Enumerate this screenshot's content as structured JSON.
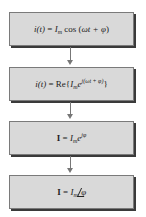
{
  "diagram": {
    "type": "flowchart",
    "direction": "top-to-bottom",
    "colors": {
      "box_fill": "#d9d9d9",
      "box_border": "#7a7a7a",
      "shadow": "#3a3a3a",
      "arrow": "#777777"
    },
    "boxes": [
      {
        "id": "step1",
        "text": "i(t) = I_m cos(ωt + φ)",
        "parts": {
          "lhs": "i(t)",
          "eq": " = ",
          "amp": "I",
          "amp_sub": "m",
          "fn": " cos (",
          "arg": "ωt + φ",
          "close": ")"
        }
      },
      {
        "id": "step2",
        "text": "i(t) = Re{I_m e^{j(ωt + φ)}}",
        "parts": {
          "lhs": "i(t)",
          "eq": " = Re{",
          "amp": "I",
          "amp_sub": "m",
          "base": "e",
          "exp": "j(ωt + φ)",
          "close": "}"
        }
      },
      {
        "id": "step3",
        "text": "I = I_m e^{jφ}",
        "parts": {
          "lhs": "I",
          "eq": " = ",
          "amp": "I",
          "amp_sub": "m",
          "base": "e",
          "exp": "jφ"
        }
      },
      {
        "id": "step4",
        "text": "I = I_m ∠φ",
        "parts": {
          "lhs": "I",
          "eq": " = ",
          "amp": "I",
          "amp_sub": "m",
          "angle": "φ"
        }
      }
    ],
    "arrows": [
      {
        "from": "step1",
        "to": "step2"
      },
      {
        "from": "step2",
        "to": "step3"
      },
      {
        "from": "step3",
        "to": "step4"
      }
    ]
  }
}
